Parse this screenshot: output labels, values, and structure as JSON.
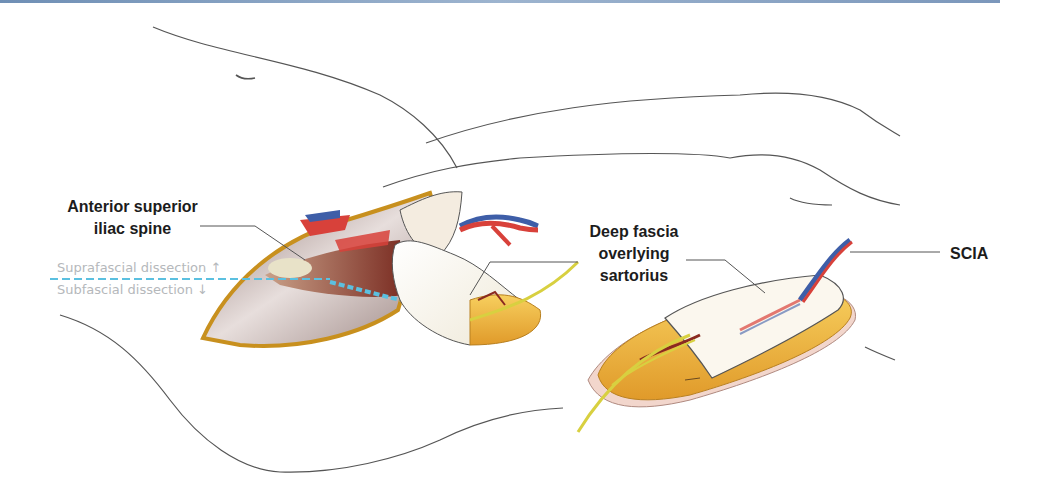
{
  "figure": {
    "type": "anatomical-illustration"
  },
  "labels": {
    "asis": {
      "line1": "Anterior superior",
      "line2": "iliac spine"
    },
    "deep_fascia": {
      "line1": "Deep fascia",
      "line2": "overlying",
      "line3": "sartorius"
    },
    "scia": "SCIA"
  },
  "dissection_planes": {
    "supra": "Suprafascial dissection ↑",
    "sub": "Subfascial dissection ↓",
    "divider_color": "#5bc0e0"
  },
  "colors": {
    "outline": "#555555",
    "leader_line": "#555555",
    "fat": "#f0b540",
    "fascia": "#f4f1e6",
    "muscle": "#8a3a2c",
    "artery": "#d8413a",
    "vein": "#3e5ea8",
    "nerve": "#d8d040",
    "skin_base": "#f2d6cc",
    "top_bar": "#7b97bb",
    "label_text": "#1c1c1c",
    "plane_text": "#b5b8bb"
  }
}
